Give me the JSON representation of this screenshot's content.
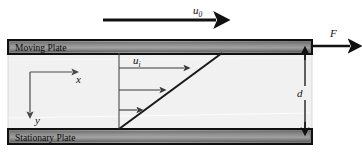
{
  "figure": {
    "background_color": "#ffffff",
    "width": 362,
    "height": 154
  },
  "plates": {
    "moving": {
      "label": "Moving Plate",
      "fill_light": "#9a9a9a",
      "fill_dark": "#5a5a5a",
      "border_color": "#111111"
    },
    "stationary": {
      "label": "Stationary Plate",
      "fill_light": "#9a9a9a",
      "fill_dark": "#5a5a5a",
      "border_color": "#111111"
    }
  },
  "fluid": {
    "name": "fluid-region",
    "fill": "#f0f0f0",
    "border_color": "#cfcfcf"
  },
  "labels": {
    "u0": "u",
    "u0_sub": "0",
    "ui": "u",
    "ui_sub": "i",
    "force": "F",
    "gap": "d",
    "axis_x": "x",
    "axis_y": "y"
  },
  "arrows": {
    "top_velocity": {
      "name": "u0-arrow",
      "x1": 103,
      "y1": 20,
      "x2": 222,
      "y2": 20,
      "color": "#111111",
      "stroke_width": 2.6
    },
    "force": {
      "name": "force-arrow",
      "x1": 312,
      "y1": 45,
      "x2": 356,
      "y2": 45,
      "color": "#111111",
      "stroke_width": 2.2
    },
    "profile": [
      {
        "name": "velocity-arrow-top",
        "x1": 119,
        "y1": 68,
        "x2": 190,
        "y2": 68
      },
      {
        "name": "velocity-arrow-middle",
        "x1": 119,
        "y1": 90,
        "x2": 166,
        "y2": 90
      },
      {
        "name": "velocity-arrow-bottom",
        "x1": 119,
        "y1": 110,
        "x2": 143,
        "y2": 110
      }
    ],
    "profile_color": "#3a3a3a",
    "profile_stroke_width": 1.1
  },
  "profile_line": {
    "name": "velocity-profile-line",
    "x1": 119,
    "y1": 129,
    "x2": 222,
    "y2": 53,
    "color": "#1a1a1a",
    "stroke_width": 2.0
  },
  "reference_line": {
    "name": "profile-reference-line",
    "x1": 119,
    "y1": 53,
    "x2": 119,
    "y2": 129,
    "color": "#4a4a4a",
    "stroke_width": 1.0
  },
  "dimension": {
    "name": "gap-dimension",
    "x": 305,
    "y_top": 53,
    "y_bottom": 129,
    "color": "#111111",
    "stroke_width": 1.4,
    "label_x": 297,
    "label_y": 95
  },
  "axes": {
    "name": "coordinate-axes",
    "origin_x": 30,
    "origin_y": 72,
    "x_end": 78,
    "y_end": 118,
    "color": "#4a4a4a",
    "stroke_width": 1.2,
    "x_label_pos": {
      "x": 81,
      "y": 83
    },
    "y_label_pos": {
      "x": 38,
      "y": 126
    }
  }
}
